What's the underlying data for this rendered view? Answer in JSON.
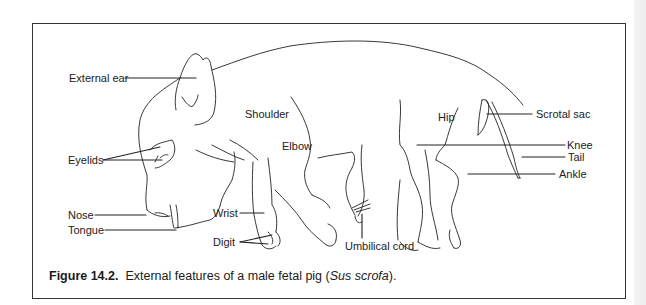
{
  "figure": {
    "number": "Figure 14.2.",
    "caption_prefix": "External features of a male fetal pig (",
    "scientific_name": "Sus scrofa",
    "caption_suffix": ")."
  },
  "labels": {
    "external_ear": "External ear",
    "shoulder": "Shoulder",
    "elbow": "Elbow",
    "eyelids": "Eyelids",
    "nose": "Nose",
    "tongue": "Tongue",
    "wrist": "Wrist",
    "digit": "Digit",
    "umbilical_cord": "Umbilical cord",
    "hip": "Hip",
    "scrotal_sac": "Scrotal sac",
    "knee": "Knee",
    "tail": "Tail",
    "ankle": "Ankle"
  },
  "colors": {
    "line": "#222222",
    "frame": "#333333",
    "background": "#ffffff"
  }
}
